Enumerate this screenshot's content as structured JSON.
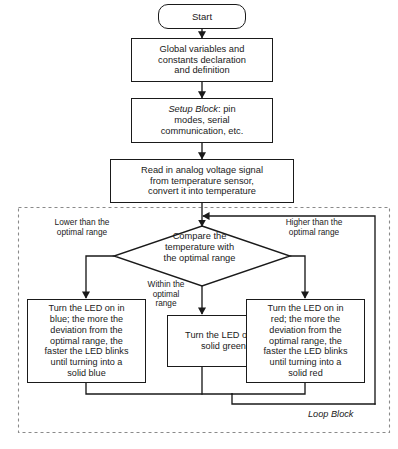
{
  "diagram": {
    "accent_color": "#1a1a1a",
    "background_color": "#ffffff"
  },
  "nodes": {
    "start": {
      "label": "Start",
      "shape": "terminal"
    },
    "globals": {
      "label": "Global variables and\nconstants declaration\nand definition",
      "shape": "process"
    },
    "setup": {
      "label_emphasis": "Setup Block",
      "label_rest": ": pin\nmodes, serial\ncommunication, etc.",
      "shape": "process"
    },
    "read": {
      "label": "Read in analog voltage signal\nfrom temperature sensor,\nconvert it into temperature",
      "shape": "process"
    },
    "compare": {
      "label": "Compare the\ntemperature with\nthe optimal range",
      "shape": "decision"
    },
    "blue": {
      "label": "Turn the LED on in\nblue; the more the\ndeviation from the\noptimal range, the\nfaster the LED blinks\nuntil turning into a\nsolid blue",
      "shape": "process"
    },
    "green": {
      "label": "Turn the LED on in\nsolid green",
      "shape": "process"
    },
    "red": {
      "label": "Turn the LED on in\nred; the more the\ndeviation from the\noptimal range, the\nfaster the LED blinks\nuntil turning into a\nsolid red",
      "shape": "process"
    }
  },
  "edge_labels": {
    "lower": "Lower than the\noptimal range",
    "within": "Within the\noptimal\nrange",
    "higher": "Higher than the\noptimal range"
  },
  "containers": {
    "loop_block": {
      "label": "Loop Block",
      "style": "dashed"
    }
  }
}
